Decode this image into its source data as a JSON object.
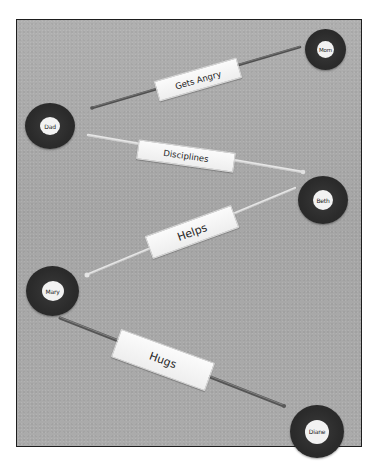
{
  "diagram": {
    "type": "family-relationship-map",
    "colors": {
      "background": "#a9a9a9",
      "frame_border": "#1e1e1e",
      "node_ring": "#2b2b2b",
      "node_center": "#f2f2f2",
      "rod_dark": "#5a5a5a",
      "rod_light": "#e2e2e2",
      "label_card": "#f6f6f6",
      "text": "#222222"
    },
    "nodes": [
      {
        "id": "mom",
        "label": "Mom"
      },
      {
        "id": "dad",
        "label": "Dad"
      },
      {
        "id": "beth",
        "label": "Beth"
      },
      {
        "id": "mary",
        "label": "Mary"
      },
      {
        "id": "diane",
        "label": "Diane"
      }
    ],
    "edges": [
      {
        "from": "Dad",
        "to": "Mom",
        "label": "Gets Angry",
        "rod": "dark"
      },
      {
        "from": "Dad",
        "to": "Beth",
        "label": "Disciplines",
        "rod": "light"
      },
      {
        "from": "Mary",
        "to": "Beth",
        "label": "Helps",
        "rod": "light"
      },
      {
        "from": "Mary",
        "to": "Diane",
        "label": "Hugs",
        "rod": "dark"
      }
    ]
  }
}
